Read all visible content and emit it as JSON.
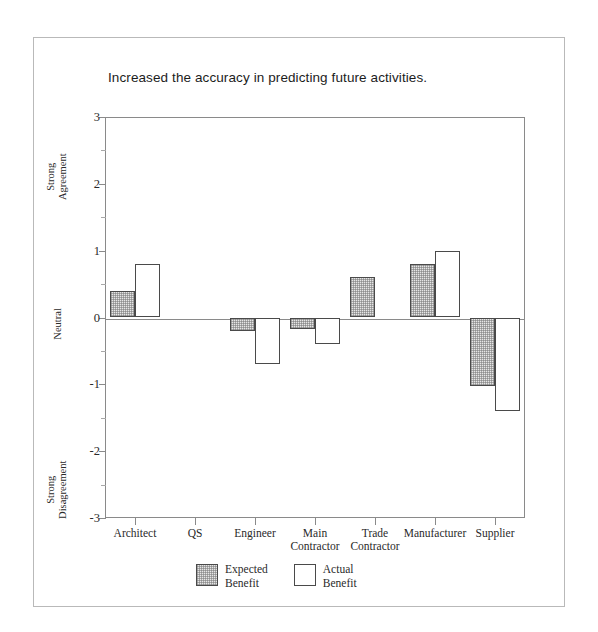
{
  "figure": {
    "background": "#ffffff",
    "frame_color": "#b9b9b9",
    "axis_color": "#8a8a8a",
    "bar_outline_color": "#4a4a4a",
    "expected_fill": "#e6e6e6",
    "actual_fill": "#ffffff"
  },
  "chart_data": {
    "type": "bar",
    "title": "Increased the accuracy in predicting future activities.",
    "xlabel": "",
    "ylabel": "",
    "ylim": [
      -3,
      3
    ],
    "yticks": [
      3,
      2,
      1,
      0,
      -1,
      -2,
      -3
    ],
    "ytick_labels": [
      "3",
      "2",
      "1",
      "0",
      "-1",
      "-2",
      "-3"
    ],
    "y_axis_annotations": [
      {
        "text": "Strong\nAgreement",
        "value": 2.3
      },
      {
        "text": "Neutral",
        "value": 0
      },
      {
        "text": "Strong\nDisagreement",
        "value": -2.3
      }
    ],
    "grid": false,
    "legend_position": "bottom-center",
    "categories": [
      "Architect",
      "QS",
      "Engineer",
      "Main Contractor",
      "Trade Contractor",
      "Manufacturer",
      "Supplier"
    ],
    "category_lines": [
      [
        "Architect"
      ],
      [
        "QS"
      ],
      [
        "Engineer"
      ],
      [
        "Main",
        "Contractor"
      ],
      [
        "Trade",
        "Contractor"
      ],
      [
        "Manufacturer"
      ],
      [
        "Supplier"
      ]
    ],
    "series": [
      {
        "name": "Expected Benefit",
        "values": [
          0.4,
          0,
          -0.2,
          -0.17,
          0.6,
          0.8,
          -1.03
        ]
      },
      {
        "name": "Actual Benefit",
        "values": [
          0.8,
          0,
          -0.7,
          -0.4,
          0,
          1.0,
          -1.4
        ]
      }
    ],
    "legend": [
      {
        "label": "Expected\nBenefit",
        "swatch": "expected"
      },
      {
        "label": "Actual\nBenefit",
        "swatch": "actual"
      }
    ]
  }
}
